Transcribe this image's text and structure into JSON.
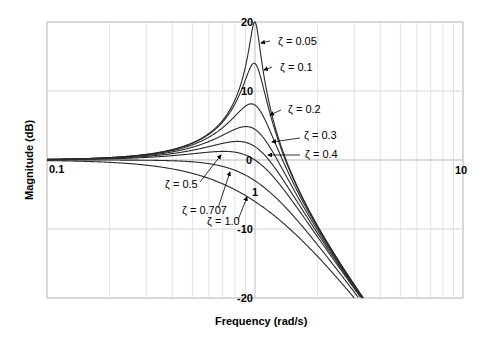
{
  "chart_data": {
    "type": "line",
    "title": "",
    "xlabel": "Frequency (rad/s)",
    "ylabel": "Magnitude (dB)",
    "xscale": "log",
    "xlim": [
      0.1,
      10
    ],
    "ylim": [
      -20,
      20
    ],
    "grid": true,
    "legend": "none (inline annotations with arrows)",
    "x_tick_labels": [
      "0.1",
      "1",
      "10"
    ],
    "y_tick_labels": [
      "20",
      "10",
      "0",
      "-10",
      "-20"
    ],
    "formula": "|G(jw)| = 1 / sqrt((1 - w^2)^2 + (2*zeta*w)^2), in dB",
    "series": [
      {
        "name": "ζ = 0.05",
        "zeta": 0.05,
        "peak_db": 20.0,
        "peak_w": 1.0
      },
      {
        "name": "ζ = 0.1",
        "zeta": 0.1,
        "peak_db": 14.0,
        "peak_w": 0.99
      },
      {
        "name": "ζ = 0.2",
        "zeta": 0.2,
        "peak_db": 8.1,
        "peak_w": 0.96
      },
      {
        "name": "ζ = 0.3",
        "zeta": 0.3,
        "peak_db": 4.8,
        "peak_w": 0.91
      },
      {
        "name": "ζ = 0.4",
        "zeta": 0.4,
        "peak_db": 2.7,
        "peak_w": 0.82
      },
      {
        "name": "ζ = 0.5",
        "zeta": 0.5,
        "peak_db": 1.25,
        "peak_w": 0.71
      },
      {
        "name": "ζ = 0.707",
        "zeta": 0.707,
        "peak_db": 0.0,
        "peak_w": 0.0
      },
      {
        "name": "ζ = 1.0",
        "zeta": 1.0,
        "peak_db": 0.0,
        "peak_w": 0.0
      }
    ],
    "sample_points_db": {
      "w": [
        0.1,
        0.5,
        1.0,
        2.0,
        3.2
      ],
      "zeta_0.05": [
        0.09,
        2.5,
        20.0,
        -9.5,
        -20.0
      ],
      "zeta_1.0": [
        -0.09,
        -1.9,
        -6.0,
        -14.0,
        -20.6
      ]
    }
  },
  "annotations": [
    {
      "label": "ζ = 0.05",
      "zeta": 0.05
    },
    {
      "label": "ζ = 0.1",
      "zeta": 0.1
    },
    {
      "label": "ζ = 0.2",
      "zeta": 0.2
    },
    {
      "label": "ζ = 0.3",
      "zeta": 0.3
    },
    {
      "label": "ζ = 0.4",
      "zeta": 0.4
    },
    {
      "label": "ζ = 0.5",
      "zeta": 0.5
    },
    {
      "label": "ζ = 0.707",
      "zeta": 0.707
    },
    {
      "label": "ζ = 1.0",
      "zeta": 1.0
    }
  ],
  "colors": {
    "curve": "#2a2a2a",
    "grid": "#d4d4d4",
    "frame": "#c8c8c8",
    "text": "#000000"
  }
}
